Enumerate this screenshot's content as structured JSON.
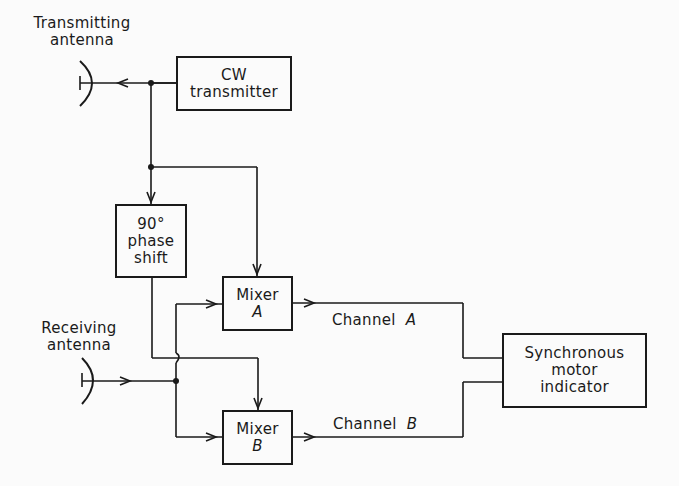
{
  "diagram": {
    "type": "block-diagram",
    "colors": {
      "line": "#1a1a1a",
      "background": "#fbfbfb"
    },
    "antennas": {
      "transmitting": {
        "line1": "Transmitting",
        "line2": "antenna"
      },
      "receiving": {
        "line1": "Receiving",
        "line2": "antenna"
      }
    },
    "blocks": {
      "cw_transmitter": {
        "line1": "CW",
        "line2": "transmitter"
      },
      "phase_shift": {
        "line1": "90°",
        "line2": "phase",
        "line3": "shift"
      },
      "mixer_a": {
        "line1": "Mixer",
        "line2": "A"
      },
      "mixer_b": {
        "line1": "Mixer",
        "line2": "B"
      },
      "indicator": {
        "line1": "Synchronous",
        "line2": "motor",
        "line3": "indicator"
      }
    },
    "channels": {
      "a": {
        "label": "Channel",
        "id": "A"
      },
      "b": {
        "label": "Channel",
        "id": "B"
      }
    },
    "connections": [
      {
        "from": "CW transmitter",
        "to": "Transmitting antenna"
      },
      {
        "from": "CW transmitter",
        "to": "90° phase shift"
      },
      {
        "from": "CW transmitter",
        "to": "Mixer A"
      },
      {
        "from": "90° phase shift",
        "to": "Mixer B"
      },
      {
        "from": "Receiving antenna",
        "to": "Mixer A"
      },
      {
        "from": "Receiving antenna",
        "to": "Mixer B"
      },
      {
        "from": "Mixer A",
        "to": "Synchronous motor indicator",
        "label": "Channel A"
      },
      {
        "from": "Mixer B",
        "to": "Synchronous motor indicator",
        "label": "Channel B"
      }
    ]
  }
}
